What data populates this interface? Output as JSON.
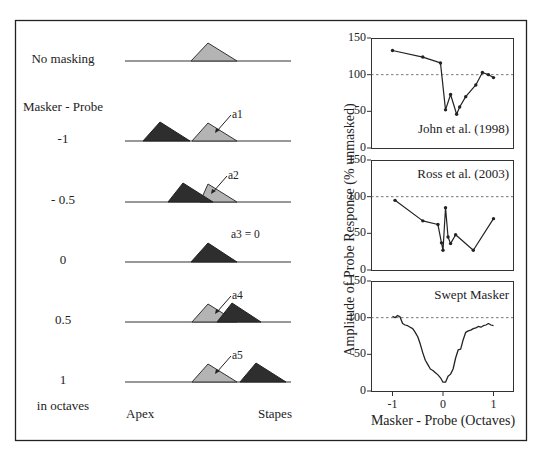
{
  "left_panel": {
    "rows": [
      {
        "label": "No masking",
        "baseline_y": 61,
        "annotation": ""
      },
      {
        "label": "-1",
        "baseline_y": 141,
        "annotation": "a1"
      },
      {
        "label": "- 0.5",
        "baseline_y": 202,
        "annotation": "a2"
      },
      {
        "label": "0",
        "baseline_y": 262,
        "annotation": "a3 = 0"
      },
      {
        "label": "0.5",
        "baseline_y": 322,
        "annotation": "a4"
      },
      {
        "label": "1",
        "baseline_y": 382,
        "annotation": "a5"
      }
    ],
    "header_label": "Masker - Probe",
    "units_label": "in octaves",
    "axis_left_label": "Apex",
    "axis_right_label": "Stapes",
    "colors": {
      "probe": "#b4b4b4",
      "masker": "#2e2e2e"
    }
  },
  "right_panel": {
    "y_axis_label": "Amplitude of Probe Response (% unmasked)",
    "x_axis_label": "Masker - Probe (Octaves)",
    "x_ticks": [
      "-1",
      "0",
      "1"
    ],
    "y_ticks": [
      "0",
      "50",
      "100",
      "150"
    ],
    "panel_titles": [
      "John et al. (1998)",
      "Ross et al. (2003)",
      "Swept Masker"
    ]
  },
  "chart_data": [
    {
      "type": "line",
      "title": "John et al. (1998)",
      "xlabel": "Masker - Probe (Octaves)",
      "ylabel": "Amplitude of Probe Response (% unmasked)",
      "xlim": [
        -1.4,
        1.4
      ],
      "ylim": [
        0,
        150
      ],
      "reference_line": 100,
      "x": [
        -1.0,
        -0.4,
        -0.05,
        0.05,
        0.15,
        0.27,
        0.33,
        0.45,
        0.65,
        0.78,
        0.9,
        1.0
      ],
      "y": [
        133,
        124,
        116,
        52,
        73,
        46,
        56,
        70,
        86,
        103,
        100,
        96
      ]
    },
    {
      "type": "line",
      "title": "Ross et al. (2003)",
      "xlim": [
        -1.4,
        1.4
      ],
      "ylim": [
        0,
        150
      ],
      "reference_line": 100,
      "x": [
        -0.95,
        -0.4,
        -0.1,
        -0.03,
        0.0,
        0.05,
        0.1,
        0.15,
        0.25,
        0.6,
        1.0
      ],
      "y": [
        95,
        67,
        62,
        37,
        27,
        85,
        45,
        36,
        48,
        27,
        70
      ]
    },
    {
      "type": "line",
      "title": "Swept Masker",
      "xlim": [
        -1.4,
        1.4
      ],
      "ylim": [
        0,
        150
      ],
      "reference_line": 100,
      "x": [
        -1.0,
        -0.95,
        -0.9,
        -0.85,
        -0.8,
        -0.75,
        -0.7,
        -0.65,
        -0.6,
        -0.55,
        -0.5,
        -0.45,
        -0.4,
        -0.35,
        -0.3,
        -0.25,
        -0.2,
        -0.15,
        -0.1,
        -0.05,
        0.0,
        0.05,
        0.1,
        0.15,
        0.2,
        0.25,
        0.3,
        0.35,
        0.4,
        0.45,
        0.5,
        0.55,
        0.6,
        0.65,
        0.7,
        0.75,
        0.8,
        0.85,
        0.9,
        0.95,
        1.0
      ],
      "y": [
        102,
        100,
        103,
        101,
        92,
        90,
        89,
        87,
        85,
        80,
        74,
        64,
        52,
        42,
        36,
        30,
        28,
        25,
        22,
        18,
        12,
        12,
        20,
        23,
        30,
        45,
        56,
        57,
        70,
        80,
        82,
        83,
        85,
        86,
        88,
        87,
        89,
        90,
        92,
        90,
        89
      ]
    }
  ]
}
